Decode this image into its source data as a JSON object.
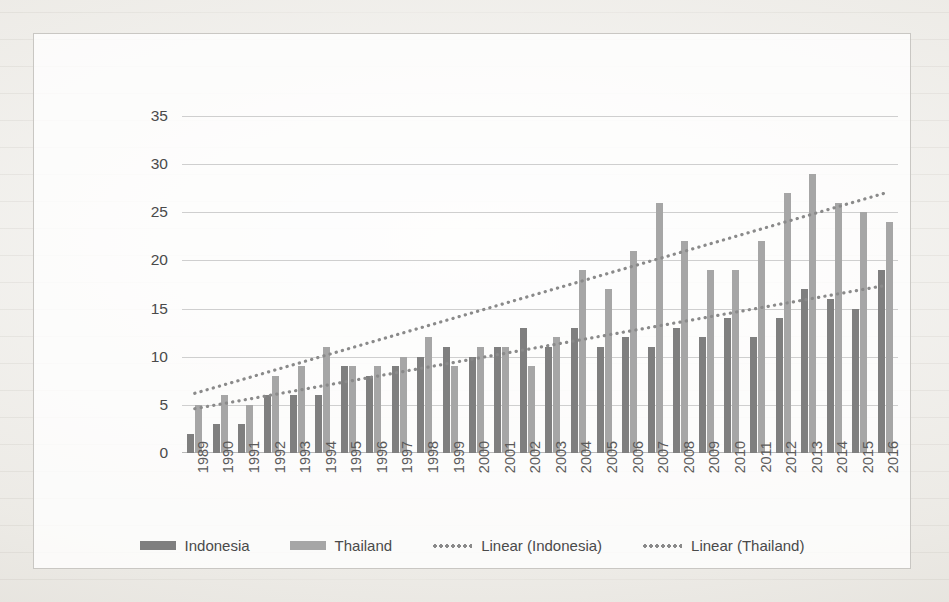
{
  "chart_data": {
    "type": "bar",
    "title": "",
    "xlabel": "",
    "ylabel": "Number of items whose RCAI>1\n(out of 57 items)",
    "ylim": [
      0,
      35
    ],
    "yticks": [
      0,
      5,
      10,
      15,
      20,
      25,
      30,
      35
    ],
    "grid": true,
    "legend_position": "bottom",
    "categories": [
      "1989",
      "1990",
      "1991",
      "1992",
      "1993",
      "1994",
      "1995",
      "1996",
      "1997",
      "1998",
      "1999",
      "2000",
      "2001",
      "2002",
      "2003",
      "2004",
      "2005",
      "2006",
      "2007",
      "2008",
      "2009",
      "2010",
      "2011",
      "2012",
      "2013",
      "2014",
      "2015",
      "2016"
    ],
    "series": [
      {
        "name": "Indonesia",
        "color": "#7f7f7f",
        "values": [
          2,
          3,
          3,
          6,
          6,
          6,
          9,
          8,
          9,
          10,
          11,
          10,
          11,
          13,
          11,
          13,
          11,
          12,
          11,
          13,
          12,
          14,
          12,
          14,
          17,
          16,
          15,
          19
        ]
      },
      {
        "name": "Thailand",
        "color": "#a6a6a6",
        "values": [
          5,
          6,
          5,
          8,
          9,
          11,
          9,
          9,
          10,
          12,
          9,
          11,
          11,
          9,
          12,
          19,
          17,
          21,
          26,
          22,
          19,
          19,
          22,
          27,
          29,
          26,
          25,
          24
        ]
      }
    ],
    "trendlines": [
      {
        "name": "Linear (Indonesia)",
        "style": "dotted",
        "color": "#8a8a8a",
        "start": 4.6,
        "end": 17.4
      },
      {
        "name": "Linear (Thailand)",
        "style": "dotted",
        "color": "#8a8a8a",
        "start": 6.2,
        "end": 27.0
      }
    ],
    "legend": [
      {
        "label": "Indonesia",
        "marker": "bar-swatch",
        "color": "#7f7f7f"
      },
      {
        "label": "Thailand",
        "marker": "bar-swatch",
        "color": "#a6a6a6"
      },
      {
        "label": "Linear (Indonesia)",
        "marker": "dotted-line",
        "color": "#8a8a8a"
      },
      {
        "label": "Linear (Thailand)",
        "marker": "dotted-line",
        "color": "#8a8a8a"
      }
    ]
  }
}
